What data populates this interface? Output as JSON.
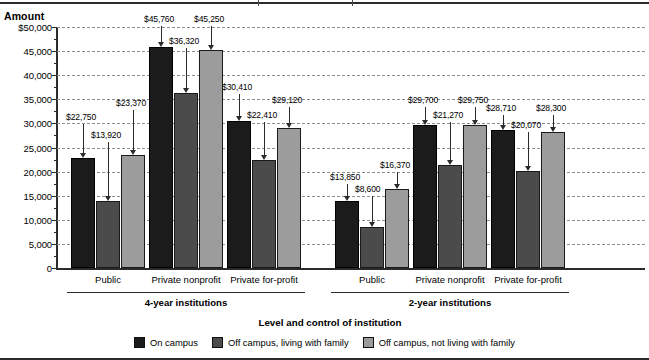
{
  "chart_data": {
    "type": "bar",
    "title": "",
    "ylabel": "Amount",
    "xlabel": "Level and control of institution",
    "ylim": [
      0,
      50000
    ],
    "grid": true,
    "legend_position": "bottom",
    "ytick_labels": [
      "$50,000",
      "45,000",
      "40,000",
      "35,000",
      "30,000",
      "25,000",
      "20,000",
      "15,000",
      "10,000",
      "5,000",
      "0"
    ],
    "ytick_values": [
      50000,
      45000,
      40000,
      35000,
      30000,
      25000,
      20000,
      15000,
      10000,
      5000,
      0
    ],
    "categories": [
      "Public",
      "Private nonprofit",
      "Private for-profit",
      "Public",
      "Private nonprofit",
      "Private for-profit"
    ],
    "supergroups": [
      {
        "label": "4-year institutions",
        "categories": [
          "Public",
          "Private nonprofit",
          "Private for-profit"
        ]
      },
      {
        "label": "2-year institutions",
        "categories": [
          "Public",
          "Private nonprofit",
          "Private for-profit"
        ]
      }
    ],
    "series": [
      {
        "name": "On campus",
        "color": "#1b1b1b",
        "values": [
          22750,
          45760,
          30410,
          13850,
          29700,
          28710
        ],
        "labels": [
          "$22,750",
          "$45,760",
          "$30,410",
          "$13,850",
          "$29,700",
          "$28,710"
        ]
      },
      {
        "name": "Off campus, living with family",
        "color": "#4b4b4b",
        "values": [
          13920,
          36320,
          22410,
          8600,
          21270,
          20070
        ],
        "labels": [
          "$13,920",
          "$36,320",
          "$22,410",
          "$8,600",
          "$21,270",
          "$20,070"
        ]
      },
      {
        "name": "Off campus, not living with family",
        "color": "#9c9c9c",
        "values": [
          23370,
          45250,
          29120,
          16370,
          29750,
          28300
        ],
        "labels": [
          "$23,370",
          "$45,250",
          "$29,120",
          "$16,370",
          "$29,750",
          "$28,300"
        ]
      }
    ]
  },
  "axis": {
    "y_title": "Amount",
    "x_title": "Level and control of institution"
  },
  "legend": {
    "items": [
      {
        "label": "On campus",
        "swatch": "oncampus"
      },
      {
        "label": "Off campus, living with family",
        "swatch": "withfamily"
      },
      {
        "label": "Off campus, not living with family",
        "swatch": "notwithfamily"
      }
    ]
  }
}
